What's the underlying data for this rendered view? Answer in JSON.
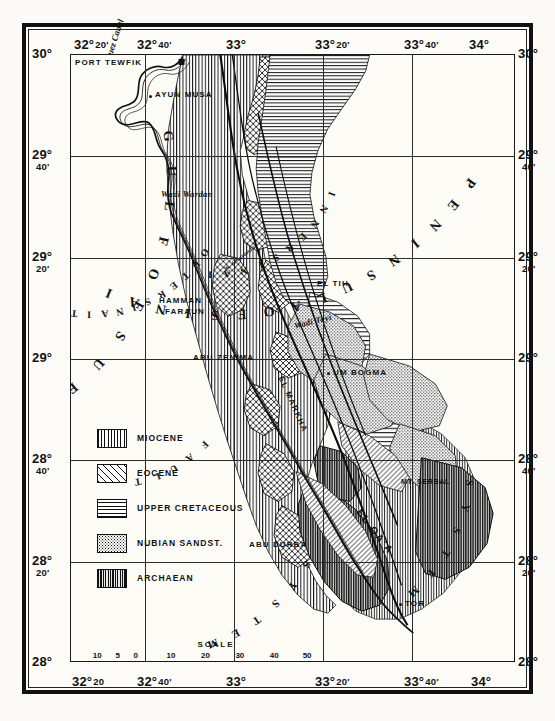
{
  "map": {
    "title": "Geological Map of the Gulf of Suez and Sinai",
    "frame": {
      "top_longitudes": [
        "32° 20'",
        "32° 40'",
        "33°",
        "33° 20'",
        "33° 40'",
        "34°"
      ],
      "bottom_longitudes": [
        "32° 20",
        "32° 40'",
        "33°",
        "33° 20'",
        "33° 40'",
        "34°"
      ],
      "left_latitudes": [
        "30°",
        "29° 40'",
        "29° 20'",
        "29°",
        "28° 40'",
        "28° 20'",
        "28°"
      ],
      "right_latitudes": [
        "30°",
        "29° 40'",
        "29° 20'",
        "29°",
        "28° 40'",
        "28° 20'",
        "28°"
      ]
    },
    "longitude_parts": [
      {
        "deg": "32°",
        "min": "20'"
      },
      {
        "deg": "32°",
        "min": "40'"
      },
      {
        "deg": "33°",
        "min": ""
      },
      {
        "deg": "33°",
        "min": "20'"
      },
      {
        "deg": "33°",
        "min": "40'"
      },
      {
        "deg": "34°",
        "min": ""
      }
    ],
    "longitude_parts_bottom": [
      {
        "deg": "32°",
        "min": "20"
      },
      {
        "deg": "32°",
        "min": "40'"
      },
      {
        "deg": "33°",
        "min": ""
      },
      {
        "deg": "33°",
        "min": "20'"
      },
      {
        "deg": "33°",
        "min": "40'"
      },
      {
        "deg": "34°",
        "min": ""
      }
    ],
    "latitude_parts": [
      {
        "deg": "30°",
        "min": ""
      },
      {
        "deg": "29°",
        "min": "40'"
      },
      {
        "deg": "29°",
        "min": "20'"
      },
      {
        "deg": "29°",
        "min": ""
      },
      {
        "deg": "28°",
        "min": "40'"
      },
      {
        "deg": "28°",
        "min": "20'"
      },
      {
        "deg": "28°",
        "min": ""
      }
    ],
    "water_label": "Suez Canal",
    "gulf_name": "GULF OF SUEZ",
    "peninsula_name": "PENINSULA OF SINAI",
    "inner_sinai": "INNER SINAI",
    "outer_sinaitic": "OUTER SINAITIC",
    "fault_label": "FAULT",
    "settlements": [
      {
        "name": "PORT TEWFIK",
        "x": 4,
        "y": 8
      },
      {
        "name": "AYUN MUSA",
        "x": 82,
        "y": 37
      },
      {
        "name": "HAMMAN",
        "x": 92,
        "y": 245
      },
      {
        "name": "FARAUN",
        "x": 98,
        "y": 256
      },
      {
        "name": "ABU ZENIMA",
        "x": 125,
        "y": 300
      },
      {
        "name": "EL TIH",
        "x": 247,
        "y": 228
      },
      {
        "name": "UM BOGMA",
        "x": 260,
        "y": 315
      },
      {
        "name": "ABU DURBA",
        "x": 180,
        "y": 487
      },
      {
        "name": "MT. SERBAL",
        "x": 330,
        "y": 425
      },
      {
        "name": "TOR",
        "x": 333,
        "y": 545
      }
    ],
    "wadis": [
      {
        "name": "Wadi Wardan",
        "x": 92,
        "y": 140
      },
      {
        "name": "W. Gharandal",
        "x": 155,
        "y": 212
      },
      {
        "name": "Wadi Tayi",
        "x": 237,
        "y": 268
      }
    ],
    "rotated_labels": [
      {
        "name": "EL MARKHA",
        "x": 215,
        "y": 330
      },
      {
        "name": "EL QA'A",
        "x": 305,
        "y": 470
      }
    ],
    "system_labels": [
      "SYSTEM",
      "SYSTEM"
    ]
  },
  "legend": {
    "items": [
      {
        "label": "MIOCENE",
        "pattern": "vertical-lines",
        "class": "p-miocene"
      },
      {
        "label": "EOCENE",
        "pattern": "cross-hatch",
        "class": "p-eocene"
      },
      {
        "label": "UPPER CRETACEOUS",
        "pattern": "horizontal-lines",
        "class": "p-cret"
      },
      {
        "label": "NUBIAN SANDST.",
        "pattern": "stipple",
        "class": "p-nubian"
      },
      {
        "label": "ARCHAEAN",
        "pattern": "dense-vertical",
        "class": "p-arch"
      }
    ]
  },
  "scale": {
    "title": "SCALE",
    "unit": "Km.",
    "ticks": [
      "10",
      "5",
      "0",
      "10",
      "20",
      "30",
      "40",
      "50"
    ]
  },
  "colors": {
    "ink": "#111111",
    "paper": "#fdfcf7",
    "grid": "#2b2b2b"
  }
}
